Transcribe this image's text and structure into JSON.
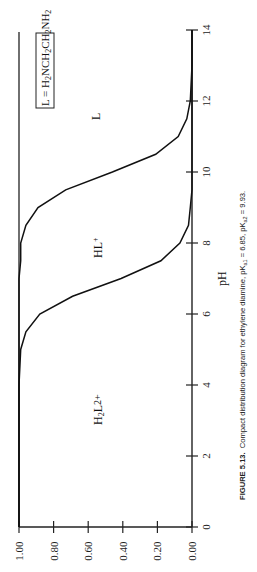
{
  "figure": {
    "caption_label": "FIGURE 5.13.",
    "caption_text": "Compact distribution diagram for ethylene diamine, pK",
    "caption_full": "FIGURE 5.13. Compact distribution diagram for ethylene diamine, pKa1 = 6.85, pKa2 = 9.93.",
    "pka1_label": "a1",
    "pka1_value": " = 6.85, pK",
    "pka2_label": "a2",
    "pka2_value": " = 9.93.",
    "rotation": "rotated 90° counter-clockwise on page"
  },
  "chart_data": {
    "type": "area",
    "title": "Compact distribution diagram for ethylene diamine",
    "xlabel": "pH",
    "ylabel": "",
    "xlim": [
      0,
      14
    ],
    "ylim": [
      0,
      1
    ],
    "x_ticks": [
      "0",
      "2",
      "4",
      "6",
      "8",
      "10",
      "12",
      "14"
    ],
    "y_ticks": [
      "0.00",
      "0.20",
      "0.40",
      "0.60",
      "0.80",
      "1.00"
    ],
    "grid": false,
    "pKa1": 6.85,
    "pKa2": 9.93,
    "ligand_label": "L = H2NCH2CH2NH2",
    "region_labels": [
      "H2L2+",
      "HL+",
      "L"
    ],
    "x": [
      0,
      2,
      4,
      5,
      5.5,
      6,
      6.5,
      7,
      7.5,
      8,
      8.5,
      9,
      9.5,
      10,
      10.5,
      11,
      11.5,
      12,
      13,
      14
    ],
    "series": [
      {
        "name": "H2L2+ (boundary H2L2+/HL+)",
        "values": [
          1.0,
          1.0,
          1.0,
          0.99,
          0.96,
          0.88,
          0.69,
          0.41,
          0.18,
          0.07,
          0.02,
          0.01,
          0.0,
          0.0,
          0.0,
          0.0,
          0.0,
          0.0,
          0.0,
          0.0
        ]
      },
      {
        "name": "H2L2+ + HL+ (boundary HL+/L)",
        "values": [
          1.0,
          1.0,
          1.0,
          1.0,
          1.0,
          1.0,
          1.0,
          1.0,
          0.99,
          0.99,
          0.96,
          0.89,
          0.73,
          0.46,
          0.21,
          0.08,
          0.03,
          0.01,
          0.0,
          0.0
        ]
      }
    ]
  },
  "labels": {
    "h2l": "H",
    "h2l_sub": "2",
    "h2l_rest": "L",
    "h2l_sup": "2+",
    "hl": "HL",
    "hl_sup": "+",
    "l": "L",
    "ligand_eq": "L = H",
    "ligand_sub1": "2",
    "ligand_mid1": "NCH",
    "ligand_sub2": "2",
    "ligand_mid2": "CH",
    "ligand_sub3": "2",
    "ligand_mid3": "NH",
    "ligand_sub4": "2"
  }
}
